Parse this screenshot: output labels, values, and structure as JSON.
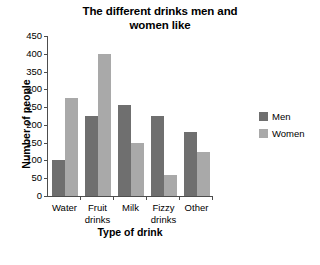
{
  "chart_data": {
    "type": "bar",
    "title": "The different drinks men and\nwomen like",
    "xlabel": "Type of drink",
    "ylabel": "Number of people",
    "categories": [
      "Water",
      "Fruit\ndrinks",
      "Milk",
      "Fizzy\ndrinks",
      "Other"
    ],
    "series": [
      {
        "name": "Men",
        "color": "#6f6f6f",
        "values": [
          100,
          225,
          257,
          225,
          180
        ]
      },
      {
        "name": "Women",
        "color": "#a9a9a9",
        "values": [
          275,
          400,
          150,
          60,
          125
        ]
      }
    ],
    "ylim": [
      0,
      450
    ],
    "yticks": [
      0,
      50,
      100,
      150,
      200,
      250,
      300,
      350,
      400,
      450
    ],
    "ytick_labels": [
      "0",
      "50",
      "100",
      "150",
      "200",
      "250",
      "300",
      "350",
      "400",
      "450"
    ],
    "grid": false,
    "legend_position": "right",
    "legend": [
      "Men",
      "Women"
    ]
  }
}
